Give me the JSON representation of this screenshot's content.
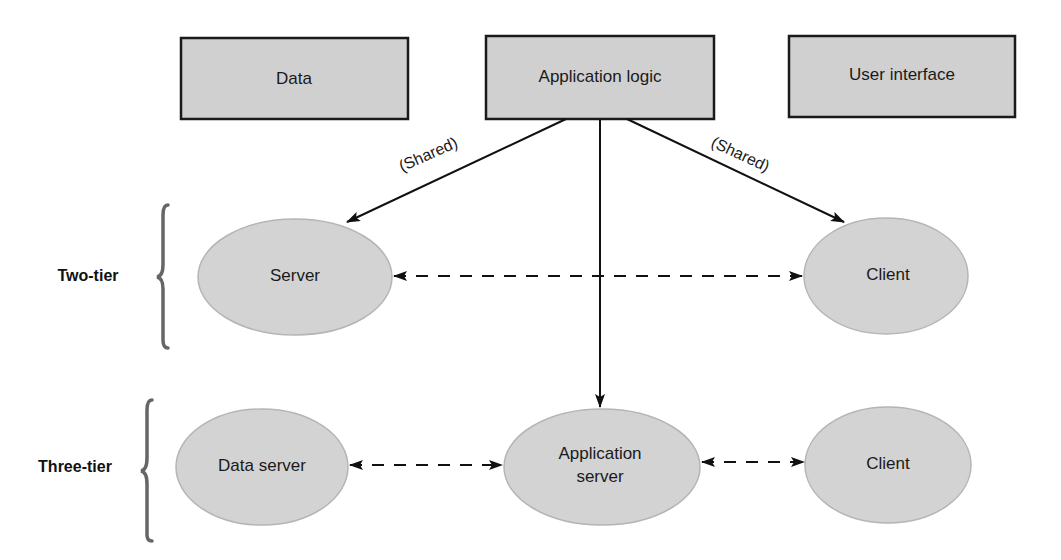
{
  "diagram": {
    "layers": [
      {
        "id": "data",
        "label": "Data"
      },
      {
        "id": "app_logic",
        "label": "Application logic"
      },
      {
        "id": "ui",
        "label": "User interface"
      }
    ],
    "tiers": {
      "two_tier": {
        "label": "Two-tier",
        "nodes": [
          {
            "id": "server",
            "label": "Server"
          },
          {
            "id": "client",
            "label": "Client"
          }
        ]
      },
      "three_tier": {
        "label": "Three-tier",
        "nodes": [
          {
            "id": "data_server",
            "label": "Data server"
          },
          {
            "id": "app_server",
            "label_line1": "Application",
            "label_line2": "server"
          },
          {
            "id": "client",
            "label": "Client"
          }
        ]
      }
    },
    "edges": [
      {
        "from": "app_logic",
        "to": "server",
        "style": "solid",
        "label": "(Shared)"
      },
      {
        "from": "app_logic",
        "to": "client",
        "style": "solid",
        "label": "(Shared)"
      },
      {
        "from": "app_logic",
        "to": "app_server",
        "style": "solid",
        "label": ""
      },
      {
        "from": "server",
        "to": "client",
        "style": "dashed-bidirectional",
        "label": ""
      },
      {
        "from": "data_server",
        "to": "app_server",
        "style": "dashed-bidirectional",
        "label": ""
      },
      {
        "from": "app_server",
        "to": "client",
        "style": "dashed-bidirectional",
        "label": ""
      }
    ],
    "colors": {
      "box_fill": "#d0d0d0",
      "ellipse_fill": "#d3d3d3",
      "line": "#111111",
      "brace": "#666666"
    }
  }
}
